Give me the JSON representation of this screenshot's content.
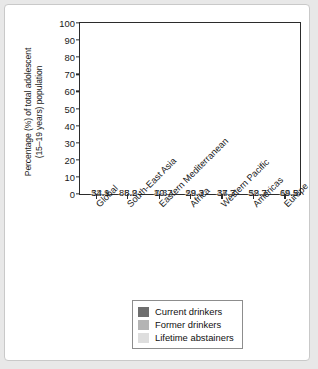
{
  "chart_data": {
    "type": "bar",
    "subtype": "stacked-100-percent",
    "title": "",
    "xlabel": "",
    "ylabel": "Percentage (%) of total adolescent\n(15–19 years) population",
    "ylim": [
      0,
      100
    ],
    "yticks": [
      100,
      90,
      80,
      70,
      60,
      50,
      40,
      30,
      20,
      10,
      0
    ],
    "grid": false,
    "legend_position": "bottom-center",
    "categories": [
      "Global",
      "South-East Asia",
      "Eastern Mediterranean",
      "Africa",
      "Western Pacific",
      "Americas",
      "Europe"
    ],
    "series": [
      {
        "name": "Current drinkers",
        "color": "#6e6e6e",
        "values": [
          34.1,
          8.2,
          10,
          29.3,
          37.3,
          52.7,
          69.5
        ]
      },
      {
        "name": "Former drinkers",
        "color": "#b4b4b4",
        "values": [
          12,
          5.9,
          7.3,
          12.3,
          14,
          18.3,
          14.5
        ]
      },
      {
        "name": "Lifetime abstainers",
        "color": "#dedede",
        "values": [
          53.9,
          85.8,
          82.7,
          58.4,
          48.7,
          29,
          15.9
        ]
      }
    ],
    "value_labels": {
      "Global": {
        "current": "34.1",
        "former": "12",
        "abstainers": "53.9"
      },
      "South-East Asia": {
        "current": "8.2",
        "former": "5.9",
        "abstainers": "85.8"
      },
      "Eastern Mediterranean": {
        "current": "10",
        "former": "7.3",
        "abstainers": "82.7"
      },
      "Africa": {
        "current": "29.3",
        "former": "12.3",
        "abstainers": "58.4"
      },
      "Western Pacific": {
        "current": "37.3",
        "former": "14",
        "abstainers": "48.7"
      },
      "Americas": {
        "current": "52.7",
        "former": "18.3",
        "abstainers": "29"
      },
      "Europe": {
        "current": "69.5",
        "former": "14.5",
        "abstainers": "15.9"
      }
    }
  },
  "axis": {
    "y_title": "Percentage (%) of total adolescent\n(15–19 years) population",
    "ticks": {
      "t100": "100",
      "t90": "90",
      "t80": "80",
      "t70": "70",
      "t60": "60",
      "t50": "50",
      "t40": "40",
      "t30": "30",
      "t20": "20",
      "t10": "10",
      "t0": "0"
    }
  },
  "legend": {
    "items": [
      {
        "label": "Current drinkers",
        "color": "#6e6e6e"
      },
      {
        "label": "Former drinkers",
        "color": "#b4b4b4"
      },
      {
        "label": "Lifetime abstainers",
        "color": "#dedede"
      }
    ]
  }
}
